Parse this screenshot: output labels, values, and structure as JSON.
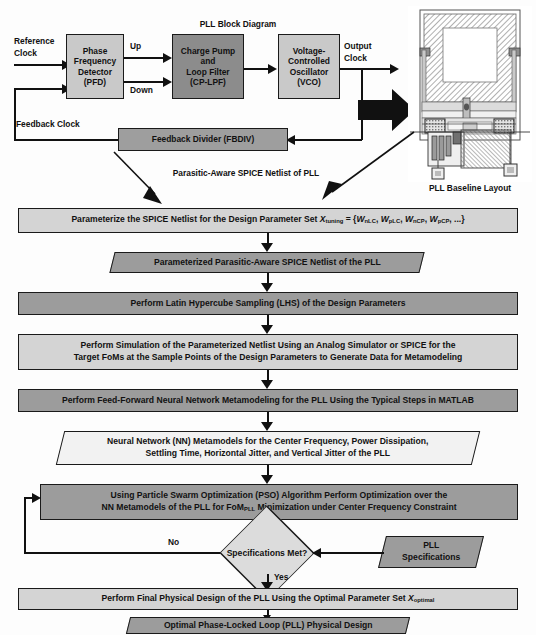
{
  "figure": {
    "block_diagram_title": "PLL Block Diagram",
    "layout_caption": "PLL Baseline Layout",
    "netlist_caption": "Parasitic-Aware SPICE Netlist of PLL"
  },
  "block_diagram": {
    "signals": {
      "reference_clock_line1": "Reference",
      "reference_clock_line2": "Clock",
      "up": "Up",
      "down": "Down",
      "output_clock_line1": "Output",
      "output_clock_line2": "Clock",
      "feedback_clock": "Feedback Clock"
    },
    "blocks": [
      {
        "id": "pfd",
        "line1": "Phase",
        "line2": "Frequency",
        "line3": "Detector",
        "line4": "(PFD)"
      },
      {
        "id": "cplpf",
        "line1": "Charge Pump",
        "line2": "and",
        "line3": "Loop Filter",
        "line4": "(CP-LPF)"
      },
      {
        "id": "vco",
        "line1": "Voltage-",
        "line2": "Controlled",
        "line3": "Oscillator",
        "line4": "(VCO)"
      },
      {
        "id": "fbdiv",
        "line1": "Feedback Divider (FBDIV)"
      }
    ]
  },
  "flow": {
    "step_parameterize_pre": "Parameterize the SPICE Netlist for the Design Parameter Set ",
    "step_parameterize_var": "X",
    "step_parameterize_sub": "tuning",
    "step_parameterize_post": " = {W",
    "param_set": "{WnLC, WpLC, WnCP, WpCP, ...}",
    "data_parameterized_netlist": "Parameterized Parasitic-Aware SPICE Netlist of the PLL",
    "step_lhs": "Perform Latin Hypercube Sampling (LHS) of the Design Parameters",
    "step_simulation_line1": "Perform Simulation of the Parameterized Netlist Using an Analog Simulator or SPICE for the",
    "step_simulation_line2": "Target FoMs at the Sample Points of the Design Parameters to Generate Data for Metamodeling",
    "step_metamodeling": "Perform Feed-Forward Neural Network Metamodeling for the PLL Using the Typical Steps in MATLAB",
    "data_nn_line1": "Neural Network (NN) Metamodels for the Center Frequency, Power Dissipation,",
    "data_nn_line2": "Settling Time, Horizontal Jitter, and Vertical Jitter of the PLL",
    "step_pso_line1": "Using Particle Swarm Optimization (PSO) Algorithm Perform Optimization over the",
    "step_pso_line2_a": "NN Metamodels of the PLL for FoM",
    "step_pso_line2_sub": "PLL",
    "step_pso_line2_b": " Minimization under Center Frequency Constraint",
    "decision": "Specifications Met?",
    "decision_no": "No",
    "decision_yes": "Yes",
    "spec_line1": "PLL",
    "spec_line2": "Specifications",
    "step_final_a": "Perform Final Physical Design of the PLL Using the Optimal Parameter Set ",
    "step_final_var": "X",
    "step_final_sub": "optimal",
    "data_optimal": "Optimal Phase-Locked Loop (PLL) Physical Design"
  },
  "colors": {
    "fill_light": "#d4d4d4",
    "fill_dark": "#9c9c9c",
    "fill_white": "#f2f2f2",
    "diamond": "#dcdcdc",
    "stroke": "#1a1a1a"
  }
}
